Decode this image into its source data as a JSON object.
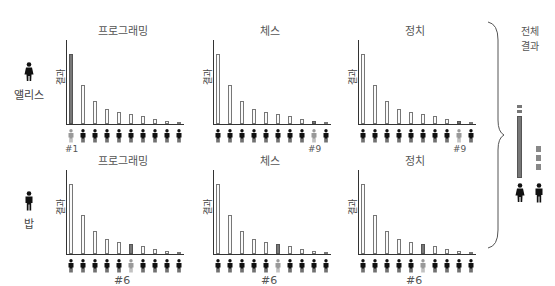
{
  "people": [
    {
      "name": "앨리스",
      "icon": "female-person-icon"
    },
    {
      "name": "밥",
      "icon": "male-person-icon"
    }
  ],
  "categories": [
    "프로그래밍",
    "체스",
    "정치"
  ],
  "ylabel": "결과",
  "overall": {
    "label_line1": "전체",
    "label_line2": "결과"
  },
  "colors": {
    "bar_fill": "#fafafa",
    "bar_highlight": "#777777",
    "person_dark": "#111111",
    "person_highlight": "#999999",
    "axis": "#333333"
  },
  "chart_data": [
    {
      "type": "bar",
      "person": "앨리스",
      "title": "프로그래밍",
      "ylabel": "결과",
      "values": [
        100,
        55,
        33,
        22,
        17,
        14,
        11,
        7,
        4,
        3
      ],
      "highlight_index": 0,
      "rank_label": "#1"
    },
    {
      "type": "bar",
      "person": "앨리스",
      "title": "체스",
      "ylabel": "결과",
      "values": [
        100,
        55,
        33,
        22,
        17,
        14,
        11,
        7,
        4,
        3
      ],
      "highlight_index": 8,
      "rank_label": "#9"
    },
    {
      "type": "bar",
      "person": "앨리스",
      "title": "정치",
      "ylabel": "결과",
      "values": [
        100,
        55,
        33,
        22,
        17,
        14,
        11,
        7,
        4,
        3
      ],
      "highlight_index": 8,
      "rank_label": "#9"
    },
    {
      "type": "bar",
      "person": "밥",
      "title": "프로그래밍",
      "ylabel": "결과",
      "values": [
        100,
        55,
        33,
        22,
        17,
        14,
        11,
        7,
        4,
        3
      ],
      "highlight_index": 5,
      "rank_label": "#6"
    },
    {
      "type": "bar",
      "person": "밥",
      "title": "체스",
      "ylabel": "결과",
      "values": [
        100,
        55,
        33,
        22,
        17,
        14,
        11,
        7,
        4,
        3
      ],
      "highlight_index": 5,
      "rank_label": "#6"
    },
    {
      "type": "bar",
      "person": "밥",
      "title": "정치",
      "ylabel": "결과",
      "values": [
        100,
        55,
        33,
        22,
        17,
        14,
        11,
        7,
        4,
        3
      ],
      "highlight_index": 5,
      "rank_label": "#6"
    }
  ],
  "overall_chart": {
    "type": "bar",
    "title": "전체 결과",
    "series": [
      {
        "person": "앨리스",
        "segments": [
          "small",
          "small",
          "large"
        ]
      },
      {
        "person": "밥",
        "segments": [
          "medium",
          "medium",
          "medium"
        ]
      }
    ]
  }
}
